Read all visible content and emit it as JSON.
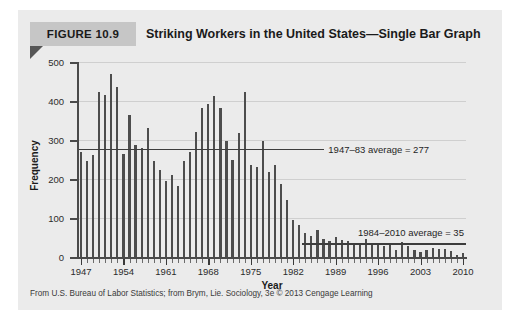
{
  "figure": {
    "label": "FIGURE 10.9",
    "title": "Striking Workers in the United States—Single Bar Graph",
    "source_note": "From U.S. Bureau of Labor Statistics; from Brym, Lie. Sociology, 3e © 2013 Cengage Learning",
    "panel_bg": "#ebebeb",
    "label_band_color": "#c6c6c6",
    "fold_color": "#565656",
    "bar_color": "#4d4d4d",
    "grid_color": "#cfcfcf",
    "axis_color": "#4a4a4a"
  },
  "chart_data": {
    "type": "bar",
    "title": "Striking Workers in the United States—Single Bar Graph",
    "xlabel": "Year",
    "ylabel": "Frequency",
    "ylim": [
      0,
      500
    ],
    "yticks": [
      0,
      100,
      200,
      300,
      400,
      500
    ],
    "xlim": [
      1947,
      2010
    ],
    "xticks": [
      1947,
      1954,
      1961,
      1968,
      1975,
      1982,
      1989,
      1996,
      2003,
      2010
    ],
    "grid": "horizontal",
    "legend": "none",
    "categories": [
      1947,
      1948,
      1949,
      1950,
      1951,
      1952,
      1953,
      1954,
      1955,
      1956,
      1957,
      1958,
      1959,
      1960,
      1961,
      1962,
      1963,
      1964,
      1965,
      1966,
      1967,
      1968,
      1969,
      1970,
      1971,
      1972,
      1973,
      1974,
      1975,
      1976,
      1977,
      1978,
      1979,
      1980,
      1981,
      1982,
      1983,
      1984,
      1985,
      1986,
      1987,
      1988,
      1989,
      1990,
      1991,
      1992,
      1993,
      1994,
      1995,
      1996,
      1997,
      1998,
      1999,
      2000,
      2001,
      2002,
      2003,
      2004,
      2005,
      2006,
      2007,
      2008,
      2009,
      2010
    ],
    "values": [
      270,
      245,
      262,
      424,
      415,
      470,
      437,
      265,
      363,
      287,
      279,
      332,
      245,
      222,
      195,
      211,
      181,
      246,
      268,
      321,
      381,
      392,
      412,
      381,
      298,
      250,
      317,
      424,
      235,
      231,
      298,
      219,
      235,
      187,
      145,
      96,
      81,
      62,
      54,
      69,
      46,
      40,
      51,
      44,
      40,
      35,
      35,
      45,
      31,
      37,
      29,
      34,
      17,
      39,
      29,
      19,
      14,
      17,
      22,
      20,
      21,
      15,
      5,
      11
    ],
    "annotations": [
      {
        "label": "1947–83 average = 277",
        "value": 277,
        "span_start": 1947,
        "span_end": 1983
      },
      {
        "label": "1984–2010 average = 35",
        "value": 35,
        "span_start": 1984,
        "span_end": 2010
      }
    ]
  }
}
